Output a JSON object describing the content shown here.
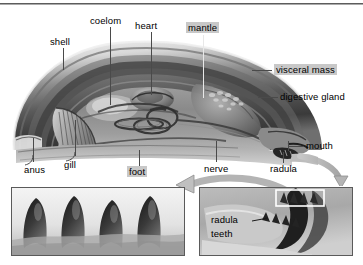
{
  "figure": {
    "title_text": "",
    "highlight_color": "#c8c8c8",
    "leader_color": "#4a4a4a"
  },
  "labels": {
    "shell": "shell",
    "coelom": "coelom",
    "heart": "heart",
    "mantle": "mantle",
    "visceral_mass": "visceral mass",
    "digestive_gland": "digestive gland",
    "mouth": "mouth",
    "radula": "radula",
    "nerve": "nerve",
    "foot": "foot",
    "gill": "gill",
    "anus": "anus"
  },
  "highlighted": [
    "mantle",
    "visceral mass",
    "foot"
  ],
  "panels": {
    "left": {
      "name": "radula-teeth-micrograph",
      "caption": "",
      "tooth_count": 4
    },
    "right": {
      "name": "radula-closeup",
      "label_line1": "radula",
      "label_line2": "teeth"
    }
  }
}
